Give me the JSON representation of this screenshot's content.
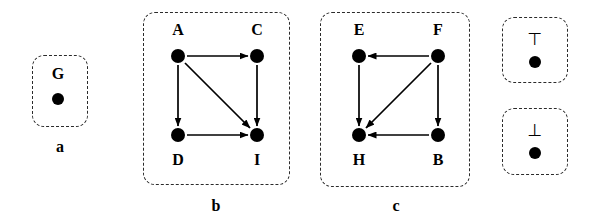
{
  "figure": {
    "background_color": "#ffffff",
    "ink_color": "#000000",
    "panel_border_style": "dashed rounded rectangle"
  },
  "panels": [
    {
      "id": "panel-a",
      "caption": "a",
      "box": {
        "x": 32,
        "y": 55,
        "w": 56,
        "h": 72
      },
      "caption_pos": {
        "x": 60,
        "y": 147
      },
      "nodes": [
        {
          "id": "G",
          "label": "G",
          "cx": 58,
          "cy": 99,
          "r": 6,
          "label_x": 58,
          "label_y": 74
        }
      ],
      "edges": []
    },
    {
      "id": "panel-b",
      "caption": "b",
      "box": {
        "x": 143,
        "y": 12,
        "w": 147,
        "h": 173
      },
      "caption_pos": {
        "x": 216,
        "y": 206
      },
      "nodes": [
        {
          "id": "A",
          "label": "A",
          "cx": 178,
          "cy": 56,
          "r": 7,
          "label_x": 178,
          "label_y": 30
        },
        {
          "id": "C",
          "label": "C",
          "cx": 257,
          "cy": 56,
          "r": 7,
          "label_x": 257,
          "label_y": 30
        },
        {
          "id": "D",
          "label": "D",
          "cx": 178,
          "cy": 135,
          "r": 7,
          "label_x": 178,
          "label_y": 160
        },
        {
          "id": "I",
          "label": "I",
          "cx": 257,
          "cy": 135,
          "r": 7,
          "label_x": 257,
          "label_y": 160
        }
      ],
      "edges": [
        {
          "from": "A",
          "to": "C",
          "x1": 187,
          "y1": 56,
          "x2": 248,
          "y2": 56
        },
        {
          "from": "A",
          "to": "D",
          "x1": 178,
          "y1": 65,
          "x2": 178,
          "y2": 126
        },
        {
          "from": "A",
          "to": "I",
          "x1": 185,
          "y1": 63,
          "x2": 250,
          "y2": 128
        },
        {
          "from": "C",
          "to": "I",
          "x1": 257,
          "y1": 65,
          "x2": 257,
          "y2": 126
        },
        {
          "from": "D",
          "to": "I",
          "x1": 187,
          "y1": 135,
          "x2": 248,
          "y2": 135
        }
      ]
    },
    {
      "id": "panel-c",
      "caption": "c",
      "box": {
        "x": 320,
        "y": 12,
        "w": 150,
        "h": 175
      },
      "caption_pos": {
        "x": 396,
        "y": 206
      },
      "nodes": [
        {
          "id": "E",
          "label": "E",
          "cx": 359,
          "cy": 56,
          "r": 7,
          "label_x": 359,
          "label_y": 30
        },
        {
          "id": "F",
          "label": "F",
          "cx": 438,
          "cy": 56,
          "r": 7,
          "label_x": 438,
          "label_y": 30
        },
        {
          "id": "H",
          "label": "H",
          "cx": 359,
          "cy": 135,
          "r": 7,
          "label_x": 359,
          "label_y": 160
        },
        {
          "id": "B",
          "label": "B",
          "cx": 438,
          "cy": 135,
          "r": 7,
          "label_x": 438,
          "label_y": 160
        }
      ],
      "edges": [
        {
          "from": "F",
          "to": "E",
          "x1": 429,
          "y1": 56,
          "x2": 368,
          "y2": 56
        },
        {
          "from": "E",
          "to": "H",
          "x1": 359,
          "y1": 65,
          "x2": 359,
          "y2": 126
        },
        {
          "from": "F",
          "to": "H",
          "x1": 431,
          "y1": 63,
          "x2": 366,
          "y2": 128
        },
        {
          "from": "F",
          "to": "B",
          "x1": 438,
          "y1": 65,
          "x2": 438,
          "y2": 126
        },
        {
          "from": "B",
          "to": "H",
          "x1": 429,
          "y1": 135,
          "x2": 368,
          "y2": 135
        }
      ]
    },
    {
      "id": "panel-top",
      "caption": "",
      "box": {
        "x": 502,
        "y": 17,
        "w": 66,
        "h": 66
      },
      "caption_pos": null,
      "nodes": [
        {
          "id": "TOP",
          "label": "⊤",
          "cx": 535,
          "cy": 62,
          "r": 6,
          "label_x": 535,
          "label_y": 39
        }
      ],
      "edges": []
    },
    {
      "id": "panel-bottom",
      "caption": "",
      "box": {
        "x": 502,
        "y": 108,
        "w": 66,
        "h": 67
      },
      "caption_pos": null,
      "nodes": [
        {
          "id": "BOT",
          "label": "⊥",
          "cx": 535,
          "cy": 153,
          "r": 6,
          "label_x": 535,
          "label_y": 130
        }
      ],
      "edges": []
    }
  ]
}
